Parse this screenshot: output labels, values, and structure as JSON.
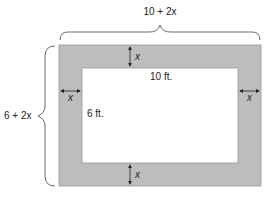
{
  "diagram": {
    "type": "border-around-rectangle",
    "colors": {
      "border_fill": "#bdbdbd",
      "border_stroke": "#9a9a9a",
      "inner_fill": "#ffffff",
      "ink": "#222222"
    },
    "labels": {
      "outer_width": "10 + 2x",
      "outer_height": "6 + 2x",
      "inner_width": "10 ft.",
      "inner_height": "6 ft.",
      "border_top": "x",
      "border_bottom": "x",
      "border_left": "x",
      "border_right": "x"
    }
  }
}
